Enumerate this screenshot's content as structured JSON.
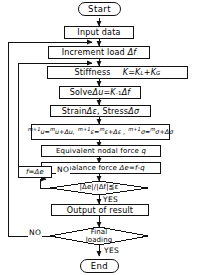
{
  "diagram": {
    "type": "flowchart",
    "ink_color": "#111111",
    "background_color": "#ffffff",
    "nodes": [
      {
        "id": "start",
        "shape": "terminator",
        "text": "Start"
      },
      {
        "id": "input",
        "shape": "process",
        "text": "Input data"
      },
      {
        "id": "increment",
        "shape": "process",
        "text": "Increment load Δf"
      },
      {
        "id": "stiffness",
        "shape": "process",
        "text": "Stiffness   K=K_L+K_G"
      },
      {
        "id": "solve",
        "shape": "process",
        "text": "Solve Δu =K⁻¹Δf"
      },
      {
        "id": "strain",
        "shape": "process",
        "text": "Strain Δε,  Stress Δσ"
      },
      {
        "id": "update",
        "shape": "process",
        "text": "m+1u = mu+Δu,  m+1ε=mε+Δε,  m+1σ=mσ+Δσ"
      },
      {
        "id": "nodalforce",
        "shape": "process",
        "text": "Equivalent nodal force q"
      },
      {
        "id": "unbalance",
        "shape": "process",
        "text": "Unbalance force Δe=f-q"
      },
      {
        "id": "reassign",
        "shape": "process",
        "text": "f =Δe"
      },
      {
        "id": "converge",
        "shape": "decision",
        "text": "|Δe|/|Δf|≦ε"
      },
      {
        "id": "output",
        "shape": "process",
        "text": "Output of result"
      },
      {
        "id": "final",
        "shape": "decision",
        "text": "Final loading"
      },
      {
        "id": "end",
        "shape": "terminator",
        "text": "End"
      }
    ],
    "edge_labels": {
      "converge_no": "NO",
      "converge_yes": "YES",
      "final_no": "NO",
      "final_yes": "YES"
    },
    "labels": {
      "start": "Start",
      "input": "Input data",
      "increment_prefix": "Increment  load",
      "increment_symbol": "Δf",
      "stiffness_word": "Stiffness",
      "stiffness_eq_K": "K",
      "stiffness_eq_rest": "=K",
      "stiffness_sub_L": "L",
      "stiffness_plus": "+K",
      "stiffness_sub_G": "G",
      "solve_word": "Solve",
      "solve_du": "Δu",
      "solve_eq": "=K",
      "solve_exp": "-1",
      "solve_df": "Δf",
      "strain_word": "Strain",
      "strain_sym": "Δε",
      "stress_word": "Stress",
      "stress_sym": "Δσ",
      "u_new_pre": "m+1",
      "u_var": "u",
      "u_eq": "=",
      "u_old_pre": "m",
      "u_old": "u",
      "u_plus": "+Δu,",
      "e_new_pre": "m+1",
      "e_var": "ε",
      "e_eq": "=",
      "e_old_pre": "m",
      "e_old": "ε",
      "e_plus": "+Δε ,",
      "s_new_pre": "m+1",
      "s_var": "σ",
      "s_eq": "=",
      "s_old_pre": "m",
      "s_old": "σ",
      "s_plus": "+Δσ",
      "nodal_text": "Equivalent  nodal force",
      "nodal_sym": "q",
      "unbalance_text": "Unbalance  force",
      "unbalance_eq": "Δe=f-q",
      "reassign_f": "f",
      "reassign_eq": "=Δe",
      "converge_num": "|Δe|/|Δf|≦ε",
      "output": "Output of result",
      "final_line1": "Final",
      "final_line2": "loading",
      "end": "End"
    }
  }
}
